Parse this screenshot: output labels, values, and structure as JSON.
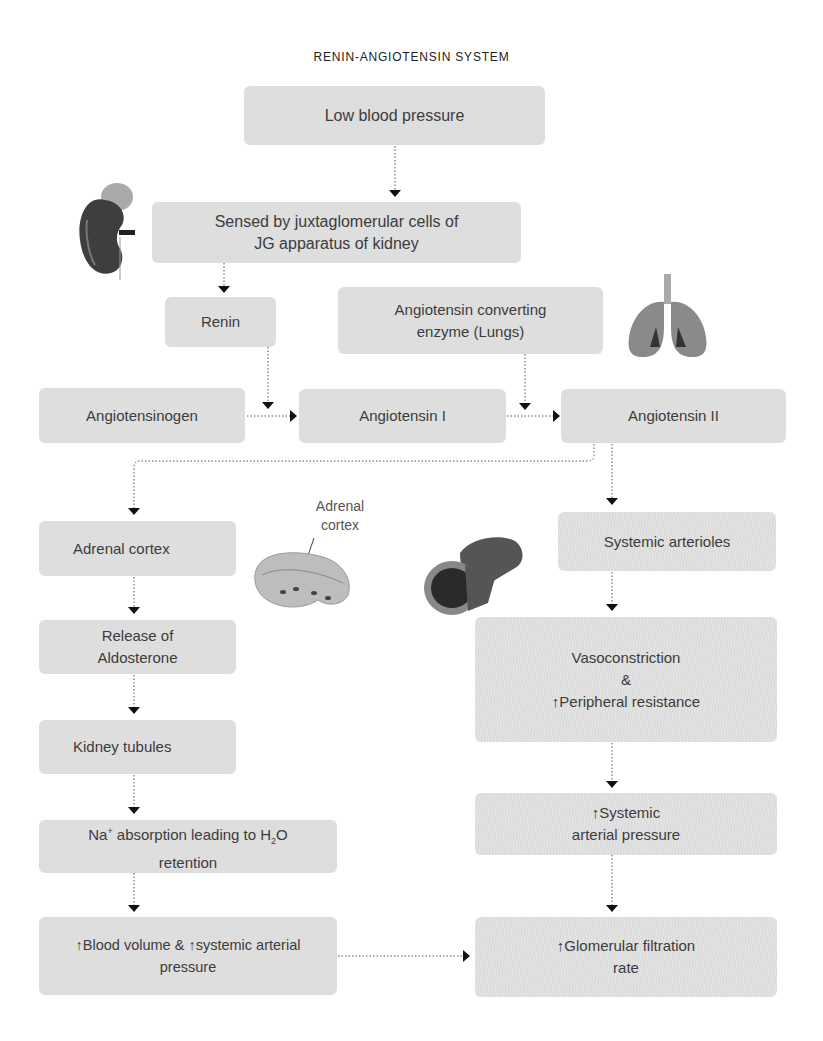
{
  "title": "RENIN-ANGIOTENSIN SYSTEM",
  "nodes": {
    "low_bp": "Low blood pressure",
    "sensed_line1": "Sensed by juxtaglomerular cells of",
    "sensed_line2": "JG apparatus of kidney",
    "renin": "Renin",
    "ace_line1": "Angiotensin converting",
    "ace_line2": "enzyme (Lungs)",
    "angiotensinogen": "Angiotensinogen",
    "angiotensin1": "Angiotensin I",
    "angiotensin2": "Angiotensin II",
    "adrenal_cortex": "Adrenal cortex",
    "release_line1": "Release of",
    "release_line2": "Aldosterone",
    "kidney_tubules": "Kidney tubules",
    "na_prefix": "Na",
    "na_sup": "+",
    "na_mid": " absorption leading to H",
    "na_sub": "2",
    "na_suffix": "O",
    "na_line2": "retention",
    "blood_arrow1": "↑",
    "blood_text1": "Blood volume & ",
    "blood_arrow2": "↑",
    "blood_text2": "systemic arterial",
    "blood_line2": "pressure",
    "systemic_arterioles": "Systemic arterioles",
    "vaso_line1": "Vasoconstriction",
    "vaso_line2": "&",
    "vaso_arrow": "↑",
    "vaso_line3": "Peripheral resistance",
    "sap_arrow": "↑",
    "sap_line1": "Systemic",
    "sap_line2": "arterial pressure",
    "gfr_arrow": "↑",
    "gfr_line1": "Glomerular filtration",
    "gfr_line2": "rate"
  },
  "illustrations": {
    "kidney": "kidney-illustration",
    "lungs": "lungs-illustration",
    "adrenal": "adrenal-gland-illustration",
    "adrenal_label_line1": "Adrenal",
    "adrenal_label_line2": "cortex",
    "artery": "artery-illustration"
  },
  "colors": {
    "box_fill": "#dedede",
    "text": "#3c3c3c",
    "connector": "#444444",
    "arrowhead": "#111111"
  }
}
